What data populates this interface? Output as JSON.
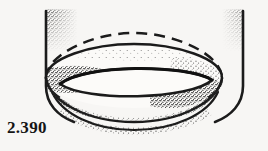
{
  "figure": {
    "catalogue_number": "2.390",
    "caption_position": "bottom-left",
    "medium": "scanned ink line drawing with stipple shading",
    "background_color": "#f7f6f4",
    "ink_color": "#1b1b1b",
    "stipple_color": "#2a2a2a",
    "elements": [
      {
        "name": "vessel-left-wall",
        "type": "solid-line",
        "description": "vertical left wall of the vessel curving inward at the base"
      },
      {
        "name": "vessel-right-wall",
        "type": "solid-line",
        "description": "vertical right wall of the vessel curving inward at the base"
      },
      {
        "name": "hidden-rim-ellipse",
        "type": "dashed-line",
        "description": "dashed upper ellipse indicating the hidden far rim of the ring"
      },
      {
        "name": "ring-outer-upper-edge",
        "type": "solid-line",
        "description": "upper outer edge of the toroidal ring"
      },
      {
        "name": "ring-inner-opening",
        "type": "solid-line",
        "description": "lens-shaped central opening of the ring"
      },
      {
        "name": "ring-outer-lower-edge",
        "type": "solid-line",
        "description": "lower outer edge of the toroidal ring"
      },
      {
        "name": "stipple-shading",
        "type": "stipple",
        "description": "dense stippled shading on the upper corners and along the ring body"
      }
    ]
  }
}
